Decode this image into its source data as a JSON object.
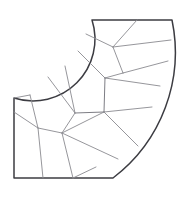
{
  "figure": {
    "shape_name": "quarter-annulus-elbow",
    "background_color": "#ffffff",
    "outline_color": "#3c3c42",
    "partition_color": "#8a8a90",
    "accent_partition_color": "#6e6e76",
    "outline_width": 1.5,
    "partition_width": 0.9,
    "canvas": {
      "width": 184,
      "height": 197
    },
    "geometry": {
      "center": {
        "x": 14,
        "y": 20
      },
      "inner_radius": 62,
      "outer_radius": 158,
      "start_angle_deg": 0,
      "sweep_angle_deg": 90
    },
    "outline_points": {
      "top_left": {
        "x": 92,
        "y": 20
      },
      "top_right": {
        "x": 172,
        "y": 20
      },
      "bottom_outer": {
        "x": 113,
        "y": 178
      },
      "bottom_left": {
        "x": 14,
        "y": 178
      },
      "inner_arc_start": {
        "x": 92,
        "y": 20
      },
      "inner_arc_end": {
        "x": 14,
        "y": 98
      }
    },
    "outline_segments": [
      "top-edge",
      "outer-arc-right",
      "bottom-edge",
      "left-edge",
      "inner-arc"
    ],
    "partition_count": 24,
    "node_points": [
      {
        "x": 113,
        "y": 47
      },
      {
        "x": 123,
        "y": 73
      },
      {
        "x": 105,
        "y": 78
      },
      {
        "x": 104,
        "y": 112
      },
      {
        "x": 75,
        "y": 113
      },
      {
        "x": 62,
        "y": 133
      },
      {
        "x": 38,
        "y": 128
      }
    ]
  }
}
